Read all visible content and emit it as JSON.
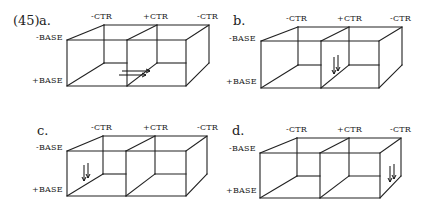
{
  "figure": {
    "number": "(45)",
    "panels": [
      {
        "id": "a",
        "label": "a.",
        "labels": {
          "top": [
            "-CTR",
            "+CTR",
            "-CTR"
          ],
          "left": [
            "-BASE",
            "+BASE"
          ]
        },
        "box": {
          "fl": 67,
          "fm": 127,
          "fr": 186,
          "bl": 104,
          "bm": 157,
          "br": 209,
          "ft": 40,
          "fb": 86,
          "bt": 25,
          "bb": 63
        },
        "arrows": {
          "direction": "right",
          "location": "floor, center divider"
        }
      },
      {
        "id": "b",
        "label": "b.",
        "labels": {
          "top": [
            "-CTR",
            "+CTR",
            "-CTR"
          ],
          "left": [
            "-BASE",
            "+BASE"
          ]
        },
        "box": {
          "fl": 261,
          "fm": 321,
          "fr": 379,
          "bl": 298,
          "bm": 349,
          "br": 402,
          "ft": 41,
          "fb": 88,
          "bt": 27,
          "bb": 65
        },
        "arrows": {
          "direction": "down",
          "location": "center divider"
        }
      },
      {
        "id": "c",
        "label": "c.",
        "labels": {
          "top": [
            "-CTR",
            "+CTR",
            "-CTR"
          ],
          "left": [
            "-BASE",
            "+BASE"
          ]
        },
        "box": {
          "fl": 67,
          "fm": 126,
          "fr": 186,
          "bl": 103,
          "bm": 155,
          "br": 207,
          "ft": 151,
          "fb": 196,
          "bt": 136,
          "bb": 174
        },
        "arrows": {
          "direction": "down",
          "location": "left wall"
        }
      },
      {
        "id": "d",
        "label": "d.",
        "labels": {
          "top": [
            "-CTR",
            "+CTR",
            "-CTR"
          ],
          "left": [
            "-BASE",
            "+BASE"
          ]
        },
        "box": {
          "fl": 260,
          "fm": 320,
          "fr": 380,
          "bl": 297,
          "bm": 349,
          "br": 401,
          "ft": 153,
          "fb": 198,
          "bt": 138,
          "bb": 176
        },
        "arrows": {
          "direction": "down",
          "location": "right wall"
        }
      }
    ]
  }
}
